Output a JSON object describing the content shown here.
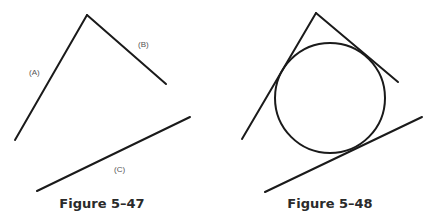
{
  "figures": [
    {
      "caption": "Figure 5–47",
      "labels": {
        "a": "(A)",
        "b": "(B)",
        "c": "(C)"
      },
      "description": "Three lines A, B, C; A and B meet at an apex"
    },
    {
      "caption": "Figure 5–48",
      "description": "Same three lines with a circle tangent to all three"
    }
  ],
  "colors": {
    "stroke": "#1a1a1a",
    "background": "#ffffff"
  }
}
